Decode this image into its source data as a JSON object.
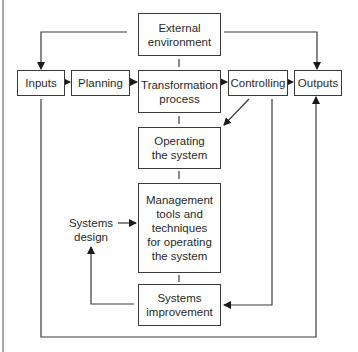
{
  "diagram": {
    "nodes": {
      "external_environment": "External\nenvironment",
      "inputs": "Inputs",
      "planning": "Planning",
      "transformation_process": "Transformation\nprocess",
      "controlling": "Controlling",
      "outputs": "Outputs",
      "operating_the_system": "Operating\nthe system",
      "management_tools": "Management\ntools and\ntechniques\nfor operating\nthe system",
      "systems_improvement": "Systems\nimprovement",
      "systems_design": "Systems\ndesign"
    },
    "edges": [
      {
        "from": "external_environment",
        "to": "inputs",
        "type": "arrow"
      },
      {
        "from": "external_environment",
        "to": "outputs",
        "type": "arrow"
      },
      {
        "from": "external_environment",
        "to": "transformation_process",
        "type": "line"
      },
      {
        "from": "inputs",
        "to": "planning",
        "type": "arrow"
      },
      {
        "from": "planning",
        "to": "transformation_process",
        "type": "arrow"
      },
      {
        "from": "transformation_process",
        "to": "controlling",
        "type": "arrow"
      },
      {
        "from": "controlling",
        "to": "outputs",
        "type": "arrow"
      },
      {
        "from": "controlling",
        "to": "operating_the_system",
        "type": "arrow"
      },
      {
        "from": "controlling",
        "to": "systems_improvement",
        "type": "arrow"
      },
      {
        "from": "transformation_process",
        "to": "operating_the_system",
        "type": "line"
      },
      {
        "from": "operating_the_system",
        "to": "management_tools",
        "type": "line"
      },
      {
        "from": "management_tools",
        "to": "systems_improvement",
        "type": "line"
      },
      {
        "from": "systems_improvement",
        "to": "systems_design",
        "type": "arrow"
      },
      {
        "from": "systems_design",
        "to": "management_tools",
        "type": "arrow"
      },
      {
        "from": "inputs",
        "to": "outputs",
        "type": "arrow",
        "note": "bottom feedback loop"
      }
    ]
  }
}
